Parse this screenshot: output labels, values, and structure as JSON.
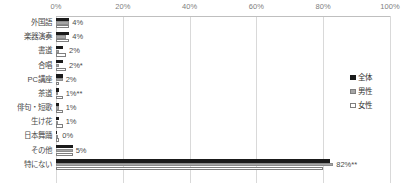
{
  "chart_data": {
    "type": "bar",
    "orientation": "horizontal",
    "title": "",
    "xlabel": "",
    "ylabel": "",
    "xlim": [
      0,
      100
    ],
    "grid": true,
    "legend_position": "right",
    "tick_labels": [
      "0%",
      "20%",
      "40%",
      "60%",
      "80%",
      "100%"
    ],
    "ticks": [
      0,
      20,
      40,
      60,
      80,
      100
    ],
    "categories": [
      "外国語",
      "楽器演奏",
      "書道",
      "合唱",
      "PC講座",
      "茶道",
      "俳句・短歌",
      "生け花",
      "日本舞踊",
      "その他",
      "特にない"
    ],
    "series": [
      {
        "name": "全体",
        "color": "#1a1a1a",
        "values": [
          4,
          4,
          2,
          2,
          2,
          1,
          1,
          1,
          0,
          5,
          82
        ]
      },
      {
        "name": "男性",
        "color": "#a6a6a6",
        "values": [
          4,
          3,
          1,
          1,
          2,
          0,
          1,
          0,
          0,
          5,
          83
        ]
      },
      {
        "name": "女性",
        "color": "#ffffff",
        "values": [
          4,
          4,
          3,
          3,
          1,
          2,
          2,
          2,
          1,
          5,
          80
        ]
      }
    ],
    "data_labels": [
      "4%",
      "4%",
      "2%",
      "2%*",
      "2%",
      "1%**",
      "1%",
      "1%",
      "0%",
      "5%",
      "82%**"
    ]
  },
  "legend": {
    "items": [
      {
        "label": "全体"
      },
      {
        "label": "男性"
      },
      {
        "label": "女性"
      }
    ]
  }
}
